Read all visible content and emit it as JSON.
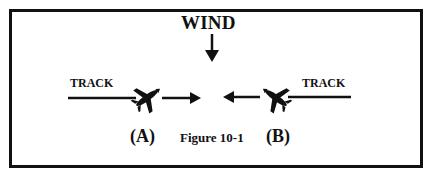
{
  "figure": {
    "caption": "Figure 10-1",
    "wind_label": "WIND",
    "left": {
      "track_label": "TRACK",
      "position_label": "(A)"
    },
    "right": {
      "track_label": "TRACK",
      "position_label": "(B)"
    },
    "icons": {
      "wind_arrow": "arrow-down-icon",
      "plane_a": "airplane-icon",
      "plane_b": "airplane-icon",
      "heading_a": "arrow-right-icon",
      "heading_b": "arrow-left-icon"
    },
    "colors": {
      "ink": "#111111",
      "background": "#ffffff"
    }
  }
}
